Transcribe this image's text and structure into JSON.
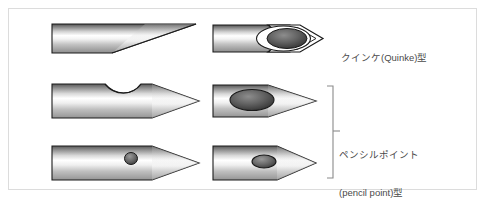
{
  "figure": {
    "title_visible": false,
    "background_color": "#ffffff",
    "frame_border_color": "#dcdcdc",
    "text_color": "#4a4a4a",
    "needle_body_colors": {
      "dark_top": "#4d4d4d",
      "mid_highlight": "#ffffff",
      "lower_gray": "#9a9a9a",
      "outline": "#1a1a1a",
      "port_dark": "#555555",
      "port_darkest": "#2b2b2b"
    }
  },
  "labels": {
    "quincke": {
      "lines": [
        "クインケ(Quinke)型"
      ],
      "name": "quincke-type-label"
    },
    "pencil_point": {
      "lines": [
        "ペンシルポイント",
        "(pencil point)型"
      ],
      "name": "pencil-point-type-label"
    }
  },
  "needles": [
    {
      "id": "needle-top-left",
      "row": 1,
      "column": "left",
      "tip_style": "long-bevel-cut",
      "has_side_port": false
    },
    {
      "id": "needle-top-right",
      "row": 1,
      "column": "right",
      "tip_style": "open-bevel-arrow-outline",
      "has_side_port": true,
      "port_shape": "large-ellipse-double-outline",
      "group": "quincke"
    },
    {
      "id": "needle-middle-left",
      "row": 2,
      "column": "left",
      "tip_style": "pencil-point-cone",
      "has_side_port": true,
      "port_shape": "top-notch-slot"
    },
    {
      "id": "needle-middle-right",
      "row": 2,
      "column": "right",
      "tip_style": "pencil-point-cone",
      "has_side_port": true,
      "port_shape": "large-ellipse",
      "group": "pencil_point"
    },
    {
      "id": "needle-bottom-left",
      "row": 3,
      "column": "left",
      "tip_style": "pencil-point-cone",
      "has_side_port": true,
      "port_shape": "small-circle"
    },
    {
      "id": "needle-bottom-right",
      "row": 3,
      "column": "right",
      "tip_style": "pencil-point-cone",
      "has_side_port": true,
      "port_shape": "small-ellipse",
      "group": "pencil_point"
    }
  ],
  "bracket": {
    "name": "pencil-point-bracket",
    "spans_rows": [
      2,
      3
    ],
    "orientation": "right-facing",
    "color": "#8a8a8a"
  }
}
